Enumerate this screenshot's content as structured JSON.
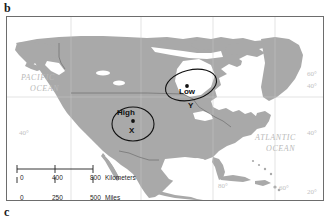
{
  "figure": {
    "panel_letter_top": "b",
    "panel_letter_bottom": "c"
  },
  "map": {
    "ocean_labels": [
      {
        "name": "pacific",
        "line1": "PACIFIC",
        "line2": "OCEAN"
      },
      {
        "name": "atlantic",
        "line1": "ATLANTIC",
        "line2": "OCEAN"
      }
    ],
    "graticule_labels": [
      {
        "name": "lat-60-right-upper",
        "text": "60°",
        "x": 300,
        "y": 54
      },
      {
        "name": "lat-40-right-upper",
        "text": "40°",
        "x": 300,
        "y": 66
      },
      {
        "name": "lat-40-left",
        "text": "40°",
        "x": 12,
        "y": 113
      },
      {
        "name": "lat-40-right-lower",
        "text": "40°",
        "x": 300,
        "y": 113
      },
      {
        "name": "lat-20-right",
        "text": "20°",
        "x": 300,
        "y": 172
      },
      {
        "name": "lon-80-bottom",
        "text": "80°",
        "x": 211,
        "y": 188
      },
      {
        "name": "lon-60-bottom",
        "text": "60°",
        "x": 272,
        "y": 190
      }
    ],
    "pressure_cells": [
      {
        "name": "high",
        "label": "High",
        "point_letter": "X"
      },
      {
        "name": "low",
        "label": "Low",
        "point_letter": "Y"
      }
    ],
    "scale": {
      "km_ticks": [
        "0",
        "400",
        "800"
      ],
      "km_unit": "Kilometers",
      "mi_ticks": [
        "0",
        "250",
        "500"
      ],
      "mi_unit": "Miles"
    },
    "colors": {
      "land": "#a9a9a9",
      "ocean": "#ffffff",
      "frame": "#6d6d6d",
      "graticule": "#c2c2c2",
      "annotation": "#111111"
    }
  }
}
